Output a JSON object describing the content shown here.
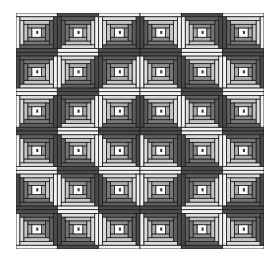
{
  "image": {
    "subject": "Log cabin quilt pattern",
    "grid": {
      "rows": 6,
      "cols": 6
    },
    "palette": {
      "light": [
        "#f2f2f2",
        "#dcdcdc",
        "#c4c4c4",
        "#ababab"
      ],
      "dark": [
        "#4a4a4a",
        "#5e5e5e",
        "#767676",
        "#8e8e8e"
      ],
      "center": "#ffffff",
      "center_mark": "#3a3a3a",
      "outline": "#1e1e1e"
    },
    "blocks": [
      [
        "TL",
        "BR",
        "TL",
        "TR",
        "BL",
        "TR"
      ],
      [
        "BR",
        "TL",
        "BR",
        "BL",
        "TR",
        "BL"
      ],
      [
        "TL",
        "BR",
        "TL",
        "TR",
        "BL",
        "TR"
      ],
      [
        "BL",
        "TR",
        "BL",
        "BL",
        "TR",
        "BL"
      ],
      [
        "TR",
        "BL",
        "TR",
        "TL",
        "BR",
        "TL"
      ],
      [
        "BL",
        "TR",
        "BL",
        "BL",
        "TR",
        "BL"
      ]
    ]
  }
}
